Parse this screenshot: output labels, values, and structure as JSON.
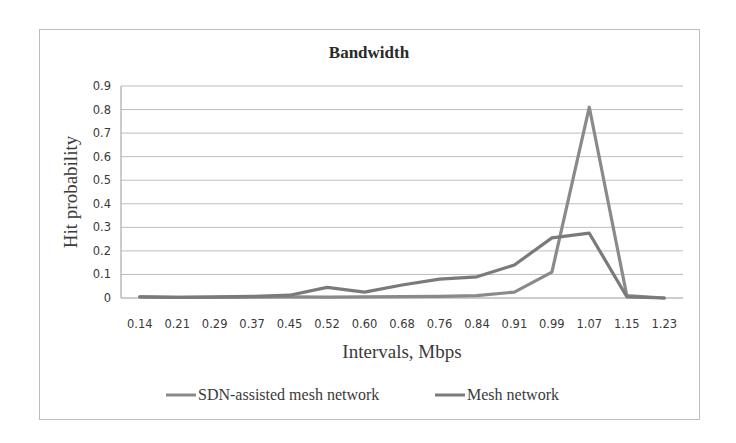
{
  "chart_data": {
    "type": "line",
    "title": "Bandwidth",
    "xlabel": "Intervals, Mbps",
    "ylabel": "Hit probability",
    "categories": [
      "0.14",
      "0.21",
      "0.29",
      "0.37",
      "0.45",
      "0.52",
      "0.60",
      "0.68",
      "0.76",
      "0.84",
      "0.91",
      "0.99",
      "1.07",
      "1.15",
      "1.23"
    ],
    "ylim": [
      0,
      0.9
    ],
    "yticks": [
      "0",
      "0.1",
      "0.2",
      "0.3",
      "0.4",
      "0.5",
      "0.6",
      "0.7",
      "0.8",
      "0.9"
    ],
    "grid": true,
    "legend_position": "bottom",
    "series": [
      {
        "name": "SDN-assisted mesh network",
        "color": "#8a8a8a",
        "values": [
          0.005,
          0.003,
          0.003,
          0.004,
          0.005,
          0.004,
          0.005,
          0.006,
          0.007,
          0.01,
          0.025,
          0.11,
          0.81,
          0.01,
          0.0
        ]
      },
      {
        "name": "Mesh network",
        "color": "#7a7a7a",
        "values": [
          0.005,
          0.003,
          0.005,
          0.007,
          0.012,
          0.045,
          0.025,
          0.055,
          0.08,
          0.09,
          0.14,
          0.255,
          0.275,
          0.005,
          0.0
        ]
      }
    ]
  }
}
